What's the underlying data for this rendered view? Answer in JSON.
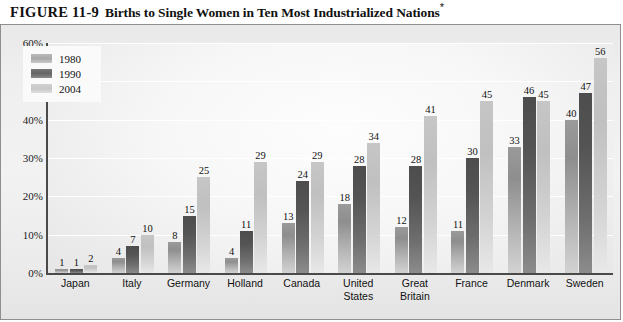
{
  "title": {
    "figure_label": "FIGURE 11-9",
    "caption": "Births to Single Women in Ten Most Industrialized Nations",
    "footnote_marker": "*"
  },
  "chart_data": {
    "type": "bar",
    "title": "Births to Single Women in Ten Most Industrialized Nations",
    "xlabel": "",
    "ylabel": "",
    "ylim": [
      0,
      60
    ],
    "ytick_labels": [
      "0%",
      "10%",
      "20%",
      "30%",
      "40%",
      "50%",
      "60%"
    ],
    "ytick_values": [
      0,
      10,
      20,
      30,
      40,
      50,
      60
    ],
    "grid": true,
    "legend_position": "top-left",
    "categories": [
      "Japan",
      "Italy",
      "Germany",
      "Holland",
      "Canada",
      "United\nStates",
      "Great\nBritain",
      "France",
      "Denmark",
      "Sweden"
    ],
    "series": [
      {
        "name": "1980",
        "color": "#9a9a9a",
        "values": [
          1,
          4,
          8,
          4,
          13,
          18,
          12,
          11,
          33,
          40
        ]
      },
      {
        "name": "1990",
        "color": "#545454",
        "values": [
          1,
          7,
          15,
          11,
          24,
          28,
          28,
          30,
          46,
          47
        ]
      },
      {
        "name": "2004",
        "color": "#c6c6c6",
        "values": [
          2,
          10,
          25,
          29,
          29,
          34,
          41,
          45,
          45,
          56
        ]
      }
    ]
  },
  "legend": {
    "items": [
      {
        "label": "1980"
      },
      {
        "label": "1990"
      },
      {
        "label": "2004"
      }
    ]
  },
  "colors": {
    "panel_background": "#eeeeee",
    "plot_background": "#f7f7f7",
    "axis": "#4a4a4a",
    "gridline": "#ffffff",
    "text": "#111111"
  }
}
